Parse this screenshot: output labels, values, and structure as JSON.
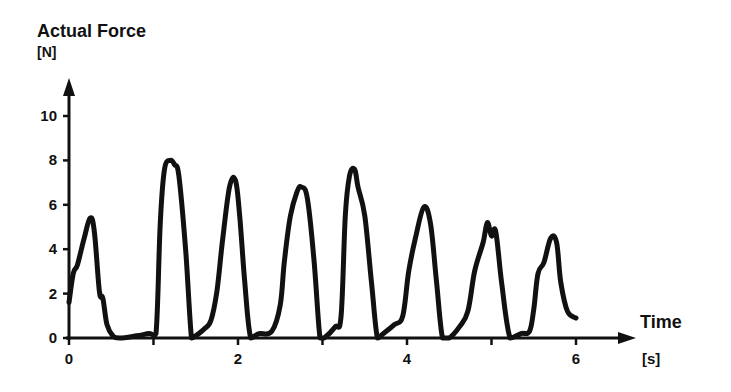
{
  "chart_data": {
    "type": "line",
    "title": "Actual Force",
    "ylabel": "Actual Force",
    "yunit": "[N]",
    "xlabel": "Time",
    "xunit": "[s]",
    "xlim": [
      0,
      6.7
    ],
    "ylim": [
      0,
      11
    ],
    "x_ticks": [
      0,
      1,
      2,
      3,
      4,
      5,
      6
    ],
    "x_tick_labels": [
      "0",
      "2",
      "4",
      "6"
    ],
    "y_ticks": [
      0,
      2,
      4,
      6,
      8,
      10
    ],
    "y_tick_labels": [
      "0",
      "2",
      "4",
      "6",
      "8",
      "10"
    ],
    "grid": false,
    "legend": null,
    "series": [
      {
        "name": "Actual Force",
        "color": "#111111",
        "peaks": [
          {
            "t": 0.25,
            "F": 5.4
          },
          {
            "t": 1.2,
            "F": 8.0
          },
          {
            "t": 1.97,
            "F": 7.1
          },
          {
            "t": 2.75,
            "F": 6.8
          },
          {
            "t": 3.38,
            "F": 7.6
          },
          {
            "t": 4.2,
            "F": 5.9
          },
          {
            "t": 4.95,
            "F": 5.2
          },
          {
            "t": 5.7,
            "F": 4.5
          }
        ],
        "x": [
          0.0,
          0.05,
          0.1,
          0.18,
          0.25,
          0.3,
          0.36,
          0.4,
          0.45,
          0.52,
          0.6,
          0.8,
          0.95,
          1.03,
          1.08,
          1.13,
          1.2,
          1.25,
          1.3,
          1.38,
          1.45,
          1.5,
          1.6,
          1.68,
          1.75,
          1.82,
          1.9,
          1.97,
          2.02,
          2.08,
          2.15,
          2.25,
          2.4,
          2.5,
          2.55,
          2.62,
          2.7,
          2.75,
          2.82,
          2.9,
          2.97,
          3.02,
          3.15,
          3.22,
          3.27,
          3.32,
          3.38,
          3.42,
          3.5,
          3.58,
          3.65,
          3.72,
          3.85,
          3.95,
          4.02,
          4.1,
          4.2,
          4.28,
          4.35,
          4.42,
          4.5,
          4.62,
          4.72,
          4.8,
          4.9,
          4.95,
          5.0,
          5.05,
          5.12,
          5.22,
          5.35,
          5.45,
          5.5,
          5.55,
          5.62,
          5.7,
          5.77,
          5.82,
          5.9,
          6.0
        ],
        "values": [
          1.6,
          2.9,
          3.3,
          4.5,
          5.4,
          4.8,
          2.1,
          1.8,
          0.6,
          0.1,
          0.0,
          0.1,
          0.2,
          0.2,
          5.2,
          7.6,
          8.0,
          7.8,
          7.3,
          4.0,
          0.0,
          0.1,
          0.4,
          0.8,
          2.1,
          4.5,
          6.8,
          7.1,
          5.5,
          2.5,
          0.0,
          0.2,
          0.3,
          1.5,
          3.5,
          5.5,
          6.6,
          6.8,
          6.3,
          3.5,
          0.0,
          0.0,
          0.5,
          1.0,
          5.5,
          7.3,
          7.6,
          6.8,
          5.5,
          2.5,
          0.0,
          0.2,
          0.6,
          1.0,
          3.0,
          4.5,
          5.9,
          5.1,
          2.5,
          0.0,
          0.0,
          0.5,
          1.2,
          3.0,
          4.3,
          5.2,
          4.6,
          4.8,
          2.5,
          0.0,
          0.2,
          0.3,
          1.3,
          2.9,
          3.4,
          4.5,
          4.3,
          2.5,
          1.2,
          0.9
        ]
      }
    ]
  }
}
